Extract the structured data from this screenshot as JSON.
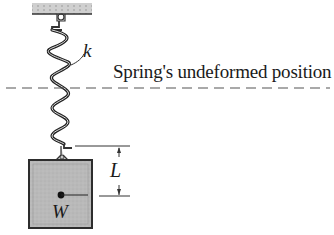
{
  "diagram": {
    "type": "spring-mass system",
    "labels": {
      "spring_constant": "k",
      "undeformed_position": "Spring's undeformed position",
      "displacement": "L",
      "weight": "W"
    },
    "colors": {
      "ceiling_fill": "#c8c8c8",
      "block_fill": "#b4b4b4",
      "block_border": "#333333",
      "line": "#222222",
      "dashed_line": "#555555"
    }
  }
}
